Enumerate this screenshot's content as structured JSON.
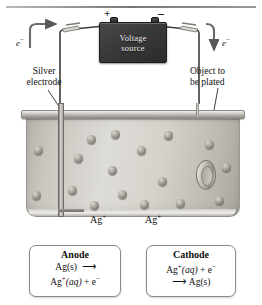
{
  "diagram": {
    "power_supply": {
      "label_line1": "Voltage",
      "label_line2": "source",
      "positive_terminal": "+",
      "negative_terminal": "−"
    },
    "labels": {
      "silver_electrode": "Silver\nelectrode",
      "silver_electrode_line1": "Silver",
      "silver_electrode_line2": "electrode",
      "object_line1": "Object to",
      "object_line2": "be plated",
      "electron_left": "e",
      "electron_right": "e",
      "electron_charge": "−",
      "ion_left": "Ag",
      "ion_right": "Ag",
      "ion_charge": "+"
    },
    "ions": {
      "count": 17,
      "species": "Ag+"
    },
    "reaction_boxes": [
      {
        "name": "anode",
        "title": "Anode",
        "line1_reactant": "Ag(s)",
        "line1_arrow": "⟶",
        "line2": "Ag⁺(aq) + e⁻",
        "line2_species": "Ag",
        "line2_charge": "+",
        "line2_state": "(aq)",
        "line2_tail": " + e",
        "line2_tail_charge": "−"
      },
      {
        "name": "cathode",
        "title": "Cathode",
        "line1": "Ag⁺(aq) + e⁻",
        "line1_species": "Ag",
        "line1_charge": "+",
        "line1_state": "(aq)",
        "line1_tail": " + e",
        "line1_tail_charge": "−",
        "line2_arrow": "⟶",
        "line2_product": "Ag(s)"
      }
    ],
    "colors": {
      "source_body": "#39393a",
      "source_text": "#f2f2f2",
      "tank_fill": "#d4d2cb",
      "ion": "#8e8b84",
      "box_border": "#8a8a8a",
      "wire": "#4c4a47",
      "arrow": "#5a5856"
    }
  }
}
